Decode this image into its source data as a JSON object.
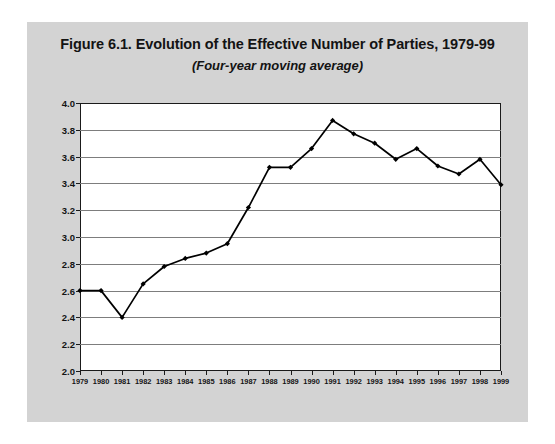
{
  "figure": {
    "title": "Figure 6.1. Evolution of the Effective Number of Parties, 1979-99",
    "subtitle": "(Four-year moving average)",
    "panel_color": "#d3d3d3",
    "plot_background": "#ffffff",
    "frame_color": "#1a1a1a",
    "gridline_color": "#7d7d7d",
    "series_color": "#000000"
  },
  "chart_data": {
    "type": "line",
    "title": "Figure 6.1. Evolution of the Effective Number of Parties, 1979-99",
    "subtitle": "(Four-year moving average)",
    "xlabel": "",
    "ylabel": "",
    "xlim": [
      1979,
      1999
    ],
    "ylim": [
      2.0,
      4.0
    ],
    "ytick_step": 0.2,
    "grid": true,
    "legend": "none",
    "marker": "filled-diamond",
    "categories": [
      "1979",
      "1980",
      "1981",
      "1982",
      "1983",
      "1984",
      "1985",
      "1986",
      "1987",
      "1988",
      "1989",
      "1990",
      "1991",
      "1992",
      "1993",
      "1994",
      "1995",
      "1996",
      "1997",
      "1998",
      "1999"
    ],
    "ytick_labels": [
      "4.0",
      "3.8",
      "3.6",
      "3.4",
      "3.2",
      "3.0",
      "2.8",
      "2.6",
      "2.4",
      "2.2",
      "2.0"
    ],
    "values": [
      2.6,
      2.6,
      2.4,
      2.65,
      2.78,
      2.84,
      2.88,
      2.95,
      3.22,
      3.52,
      3.52,
      3.66,
      3.87,
      3.77,
      3.7,
      3.58,
      3.66,
      3.53,
      3.47,
      3.58,
      3.39
    ],
    "series": [
      {
        "name": "Effective number of parties",
        "values": [
          2.6,
          2.6,
          2.4,
          2.65,
          2.78,
          2.84,
          2.88,
          2.95,
          3.22,
          3.52,
          3.52,
          3.66,
          3.87,
          3.77,
          3.7,
          3.58,
          3.66,
          3.53,
          3.47,
          3.58,
          3.39
        ]
      }
    ]
  }
}
